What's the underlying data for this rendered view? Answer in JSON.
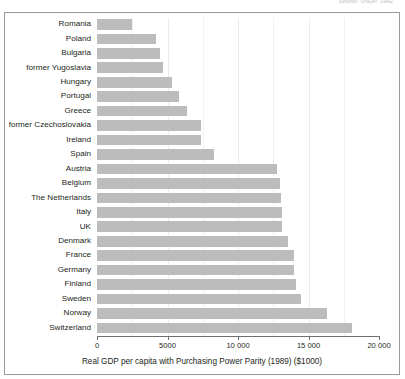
{
  "source_note": "Source: UNDP, 1992",
  "chart_data": {
    "type": "bar",
    "orientation": "horizontal",
    "title": "",
    "xlabel": "Real GDP per capita with Purchasing Power Parity (1989) ($1000)",
    "ylabel": "",
    "xlim": [
      0,
      20000
    ],
    "xticks": [
      0,
      5000,
      10000,
      15000,
      20000
    ],
    "xticklabels": [
      "0",
      "5000",
      "10 000",
      "15 000",
      "20 000"
    ],
    "grid": true,
    "legend": false,
    "bar_color": "#bcbcbc",
    "categories": [
      "Romania",
      "Poland",
      "Bulgaria",
      "former Yugoslavia",
      "Hungary",
      "Portugal",
      "Greece",
      "former Czechoslovakia",
      "Ireland",
      "Spain",
      "Austria",
      "Belgium",
      "The Netherlands",
      "Italy",
      "UK",
      "Denmark",
      "France",
      "Germany",
      "Finland",
      "Sweden",
      "Norway",
      "Switzerland"
    ],
    "values": [
      2450,
      4150,
      4500,
      4650,
      5350,
      5800,
      6400,
      7350,
      7400,
      8300,
      12800,
      12950,
      13050,
      13150,
      13150,
      13550,
      13950,
      14000,
      14100,
      14450,
      16300,
      18100
    ]
  }
}
